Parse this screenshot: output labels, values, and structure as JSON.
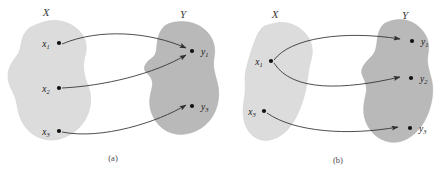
{
  "figure": {
    "title": "",
    "background_color": "#ffffff",
    "colors": {
      "domain_blob": "#dcdcdc",
      "codomain_blob": "#b9b9b9",
      "arrow": "#2e2e2e",
      "dot": "#111111",
      "label_text": "#1a1a1a",
      "caption_text": "#4a4a4a"
    }
  },
  "panels": [
    {
      "id": "panel-a",
      "caption": "(a)",
      "sets": {
        "domain": {
          "label": "X"
        },
        "codomain": {
          "label": "Y"
        }
      },
      "domain_points": [
        {
          "id": "x1",
          "base": "x",
          "sub": "1"
        },
        {
          "id": "x2",
          "base": "x",
          "sub": "2"
        },
        {
          "id": "x3",
          "base": "x",
          "sub": "3"
        }
      ],
      "codomain_points": [
        {
          "id": "y1",
          "base": "y",
          "sub": "1"
        },
        {
          "id": "y3",
          "base": "y",
          "sub": "3"
        }
      ],
      "mappings": [
        {
          "from": "x1",
          "to": "y1"
        },
        {
          "from": "x2",
          "to": "y1"
        },
        {
          "from": "x3",
          "to": "y3"
        }
      ]
    },
    {
      "id": "panel-b",
      "caption": "(b)",
      "sets": {
        "domain": {
          "label": "X"
        },
        "codomain": {
          "label": "Y"
        }
      },
      "domain_points": [
        {
          "id": "x1",
          "base": "x",
          "sub": "1"
        },
        {
          "id": "x3",
          "base": "x",
          "sub": "3"
        }
      ],
      "codomain_points": [
        {
          "id": "y1",
          "base": "y",
          "sub": "1"
        },
        {
          "id": "y2",
          "base": "y",
          "sub": "2"
        },
        {
          "id": "y3",
          "base": "y",
          "sub": "3"
        }
      ],
      "mappings": [
        {
          "from": "x1",
          "to": "y1"
        },
        {
          "from": "x1",
          "to": "y2"
        },
        {
          "from": "x3",
          "to": "y3"
        }
      ]
    }
  ]
}
